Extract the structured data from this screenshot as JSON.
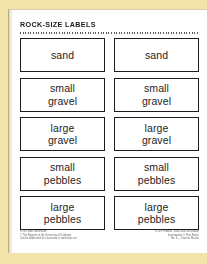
{
  "document": {
    "title": "ROCK-SIZE LABELS",
    "background_color": "#f2e3a8",
    "page_color": "#ffffff",
    "ink_color": "#1c1c1c"
  },
  "labels": {
    "columns": 2,
    "rows": [
      {
        "lines": [
          "sand"
        ]
      },
      {
        "lines": [
          "small",
          "gravel"
        ]
      },
      {
        "lines": [
          "large",
          "gravel"
        ]
      },
      {
        "lines": [
          "small",
          "pebbles"
        ]
      },
      {
        "lines": [
          "large",
          "pebbles"
        ]
      }
    ]
  },
  "footer": {
    "left_lines": [
      "FOSS Next Generation",
      "© The Regents of the University of California",
      "Can be duplicated for classroom or workshop use"
    ],
    "right_lines": [
      "FOSS Pebbles, Sand, and Silt Module",
      "Investigation 1: First Rocks",
      "No. 4 — Teacher Master"
    ]
  }
}
